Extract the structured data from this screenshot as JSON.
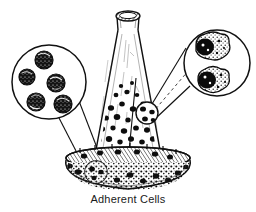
{
  "figure": {
    "caption": "Adherent Cells",
    "background_color": "#ffffff",
    "ink_color": "#000000",
    "title_alt": "Adherent cells growing on the bottom of a culture flask",
    "vessel": {
      "name": "erlenmeyer-flask",
      "label": "culture flask",
      "neck_top_y": 10,
      "base_y": 188
    },
    "callouts": [
      {
        "id": "left",
        "name": "suspension-cells-callout",
        "label": "Rounded cells",
        "cx": 49,
        "cy": 82,
        "r": 37,
        "source_cx": 96,
        "source_cy": 172,
        "source_r": 11,
        "cell_count": 5,
        "cell_shape": "round",
        "cells": [
          {
            "cx": 44,
            "cy": 60,
            "r": 9
          },
          {
            "cx": 27,
            "cy": 77,
            "r": 8
          },
          {
            "cx": 56,
            "cy": 83,
            "r": 9
          },
          {
            "cx": 36,
            "cy": 102,
            "r": 9
          },
          {
            "cx": 63,
            "cy": 104,
            "r": 9
          }
        ]
      },
      {
        "id": "right",
        "name": "adherent-cells-callout",
        "label": "Flattened adherent cells",
        "cx": 217,
        "cy": 63,
        "r": 33,
        "source_cx": 147,
        "source_cy": 113,
        "source_r": 11,
        "cell_count": 2,
        "cell_shape": "irregular-flattened",
        "cells": [
          {
            "cx": 211,
            "cy": 48,
            "rx": 18,
            "ry": 14
          },
          {
            "cx": 214,
            "cy": 81,
            "rx": 17,
            "ry": 13
          }
        ]
      }
    ],
    "media": {
      "name": "culture-medium",
      "surface_cy": 158,
      "surface_rx": 62,
      "surface_ry": 11
    },
    "suspended_cell_count": 46,
    "monolayer_cell_count": 40
  }
}
